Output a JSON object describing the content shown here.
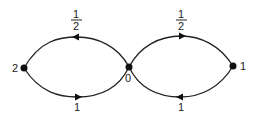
{
  "diagram": {
    "type": "directed-graph",
    "nodes": [
      {
        "id": "left",
        "label": "2",
        "x": 24,
        "y": 68
      },
      {
        "id": "center",
        "label": "0",
        "x": 129,
        "y": 67
      },
      {
        "id": "right",
        "label": "1",
        "x": 233,
        "y": 66
      }
    ],
    "edges": [
      {
        "id": "left-top",
        "from": "center",
        "to": "left",
        "direction": "leftward",
        "label_num": "1",
        "label_den": "2"
      },
      {
        "id": "left-bottom",
        "from": "left",
        "to": "center",
        "direction": "rightward",
        "label": "1"
      },
      {
        "id": "right-top",
        "from": "center",
        "to": "right",
        "direction": "rightward",
        "label_num": "1",
        "label_den": "2"
      },
      {
        "id": "right-bottom",
        "from": "right",
        "to": "center",
        "direction": "leftward",
        "label": "1"
      }
    ]
  }
}
